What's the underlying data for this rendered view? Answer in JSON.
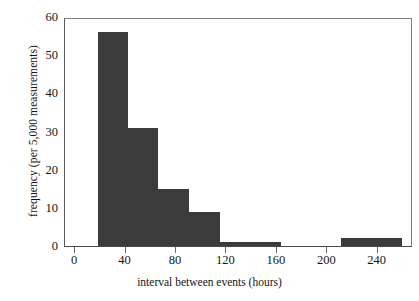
{
  "chart_data": {
    "type": "bar",
    "title": "",
    "subtitle": "",
    "xlabel": "interval between events (hours)",
    "ylabel": "frequency (per 5,000 measurements)",
    "xlim": [
      -8,
      268
    ],
    "ylim": [
      0,
      60
    ],
    "grid": false,
    "legend": null,
    "bar_color": "#3b3b3b",
    "axis_color": "#4a4a4a",
    "bin_edges": [
      18,
      42,
      66,
      90,
      115,
      139,
      163,
      187,
      211,
      235,
      259
    ],
    "bin_labels": [
      "18-42",
      "42-66",
      "66-90",
      "90-115",
      "115-139",
      "139-163",
      "163-187",
      "187-211",
      "211-235",
      "235-259"
    ],
    "values": [
      56,
      31,
      15,
      9,
      1,
      1,
      0,
      0,
      2,
      2
    ],
    "categories": [
      "18",
      "42",
      "66",
      "90",
      "115",
      "139",
      "163",
      "187",
      "211",
      "235"
    ],
    "xticks": [
      {
        "value": 0,
        "label": "0"
      },
      {
        "value": 40,
        "label": "40"
      },
      {
        "value": 80,
        "label": "80"
      },
      {
        "value": 120,
        "label": "120"
      },
      {
        "value": 160,
        "label": "160"
      },
      {
        "value": 200,
        "label": "200"
      },
      {
        "value": 240,
        "label": "240"
      }
    ],
    "yticks": [
      {
        "value": 0,
        "label": "0"
      },
      {
        "value": 10,
        "label": "10"
      },
      {
        "value": 20,
        "label": "20"
      },
      {
        "value": 30,
        "label": "30"
      },
      {
        "value": 40,
        "label": "40"
      },
      {
        "value": 50,
        "label": "50"
      },
      {
        "value": 60,
        "label": "60"
      }
    ]
  }
}
